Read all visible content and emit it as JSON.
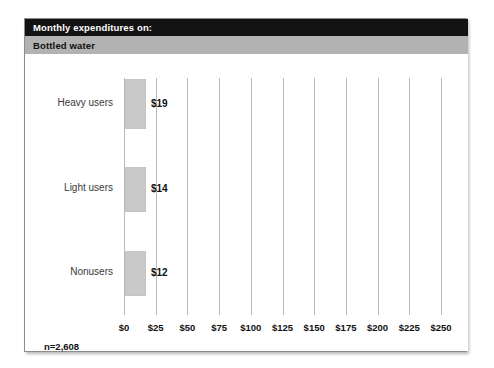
{
  "card": {
    "title": "Monthly expenditures on:",
    "subtitle": "Bottled water",
    "sample_size": "n=2,608",
    "colors": {
      "title_bar_bg": "#131313",
      "title_bar_text": "#ffffff",
      "subtitle_bar_bg": "#b2b2b2",
      "subtitle_bar_text": "#101010",
      "bar_fill": "#c9c9c9",
      "gridline": "#b9b9b9",
      "panel_border": "#8c8c8c",
      "panel_bg": "#ffffff",
      "category_label": "#3a3a3a"
    }
  },
  "chart_data": {
    "type": "bar",
    "orientation": "horizontal",
    "title": "Monthly expenditures on:",
    "subtitle": "Bottled water",
    "categories": [
      "Heavy users",
      "Light users",
      "Nonusers"
    ],
    "values": [
      19,
      14,
      12
    ],
    "value_labels": [
      "$19",
      "$14",
      "$12"
    ],
    "xlabel": "",
    "ylabel": "",
    "xlim": [
      0,
      250
    ],
    "xtick_values": [
      0,
      25,
      50,
      75,
      100,
      125,
      150,
      175,
      200,
      225,
      250
    ],
    "xtick_labels": [
      "$0",
      "$25",
      "$50",
      "$75",
      "$100",
      "$125",
      "$150",
      "$175",
      "$200",
      "$225",
      "$250"
    ],
    "grid": true,
    "grid_axis": "x",
    "legend": false,
    "annotations": [
      "n=2,608"
    ]
  }
}
